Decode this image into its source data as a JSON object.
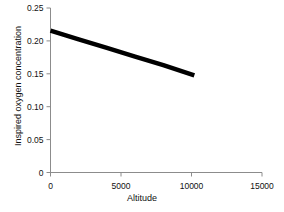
{
  "chart_data": {
    "type": "line",
    "title": "",
    "subtitle": "",
    "xlabel": "Altitude",
    "ylabel": "Inspired oxygen concentration",
    "xlim": [
      0,
      15000
    ],
    "ylim": [
      0,
      0.25
    ],
    "grid": false,
    "legend": null,
    "xticks": [
      0,
      5000,
      10000,
      15000
    ],
    "xtick_labels": [
      "0",
      "5000",
      "10000",
      "15000"
    ],
    "yticks": [
      0,
      0.05,
      0.1,
      0.15,
      0.2,
      0.25
    ],
    "ytick_labels": [
      "0",
      "0.05",
      "0.10",
      "0.15",
      "0.20",
      "0.25"
    ],
    "series": [
      {
        "name": "Inspired oxygen concentration",
        "color": "#000000",
        "line_width": 4.5,
        "x": [
          0,
          2000,
          4000,
          6000,
          8000,
          10200
        ],
        "y": [
          0.2155,
          0.2024,
          0.1893,
          0.1762,
          0.1631,
          0.1475
        ],
        "points": [
          {
            "x": 0,
            "y": 0.2155
          },
          {
            "x": 10200,
            "y": 0.1475
          }
        ]
      }
    ],
    "annotations": []
  },
  "axes": {
    "spine_color": "#8c8c8c",
    "tick_color": "#8c8c8c",
    "text_color": "#111111",
    "background": "#ffffff"
  }
}
